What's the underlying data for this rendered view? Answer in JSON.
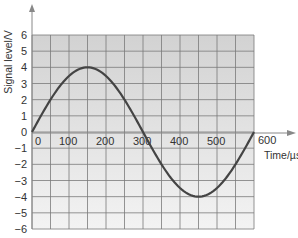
{
  "chart_data": {
    "type": "line",
    "title": "",
    "xlabel": "Time/µs",
    "ylabel": "Signal level/V",
    "xlim": [
      0,
      600
    ],
    "ylim": [
      -6,
      6
    ],
    "x_ticks": [
      "0",
      "100",
      "200",
      "300",
      "400",
      "500",
      "600"
    ],
    "y_ticks": [
      "6",
      "5",
      "4",
      "3",
      "2",
      "1",
      "0",
      "-1",
      "-2",
      "-3",
      "-4",
      "-5",
      "-6"
    ],
    "grid": true,
    "legend": null,
    "series": [
      {
        "name": "sine wave",
        "amplitude": 4,
        "period_us": 600,
        "x": [
          0,
          50,
          100,
          150,
          200,
          250,
          300,
          350,
          400,
          450,
          500,
          550,
          600
        ],
        "values": [
          0,
          2,
          3.46,
          4,
          3.46,
          2,
          0,
          -2,
          -3.46,
          -4,
          -3.46,
          -2,
          0
        ]
      }
    ],
    "colors": {
      "plot_bg_top": "#d4d4d4",
      "plot_bg_bottom": "#f2f2f2",
      "grid": "#7a7a7a",
      "curve": "#444444",
      "axis": "#888888"
    }
  },
  "labels": {
    "ylabel": "Signal level/V",
    "xlabel": "Time/µs",
    "x600": "600"
  }
}
